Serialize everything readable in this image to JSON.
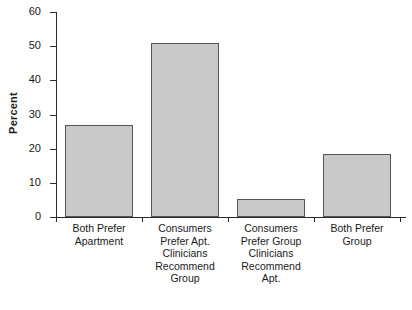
{
  "chart_data": {
    "type": "bar",
    "title": "",
    "xlabel": "",
    "ylabel": "Percent",
    "ylim": [
      0,
      60
    ],
    "yticks": [
      0,
      10,
      20,
      30,
      40,
      50,
      60
    ],
    "ytick_labels": [
      "0",
      "10",
      "20",
      "30",
      "40",
      "50",
      "60"
    ],
    "grid": false,
    "legend": false,
    "categories": [
      "Both Prefer\nApartment",
      "Consumers\nPrefer Apt.\nClinicians\nRecommend\nGroup",
      "Consumers\nPrefer Group\nClinicians\nRecommend\nApt.",
      "Both Prefer\nGroup"
    ],
    "category_lines": [
      [
        "Both Prefer",
        "Apartment"
      ],
      [
        "Consumers",
        "Prefer Apt.",
        "Clinicians",
        "Recommend",
        "Group"
      ],
      [
        "Consumers",
        "Prefer Group",
        "Clinicians",
        "Recommend",
        "Apt."
      ],
      [
        "Both Prefer",
        "Group"
      ]
    ],
    "values": [
      27,
      51,
      5.3,
      18.5
    ],
    "bar_color": "#c9c9c9",
    "bar_edge_color": "#555555",
    "axis_color": "#2b2b2b",
    "background": "#ffffff"
  }
}
